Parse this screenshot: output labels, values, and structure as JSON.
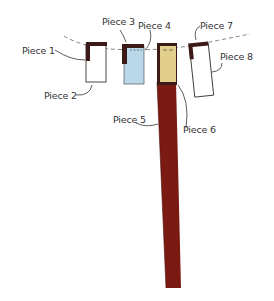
{
  "diagram": {
    "title": "",
    "labels": [
      {
        "id": "piece-1",
        "text": "Piece 1"
      },
      {
        "id": "piece-2",
        "text": "Piece 2"
      },
      {
        "id": "piece-3",
        "text": "Piece 3"
      },
      {
        "id": "piece-4",
        "text": "Piece 4"
      },
      {
        "id": "piece-5",
        "text": "Piece 5"
      },
      {
        "id": "piece-6",
        "text": "Piece 6"
      },
      {
        "id": "piece-7",
        "text": "Piece 7"
      },
      {
        "id": "piece-8",
        "text": "Piece 8"
      }
    ],
    "colors": {
      "dark_brown": "#3b1a17",
      "light_blue": "#b9d8ea",
      "tan": "#e2cf8b",
      "dark_red": "#7b1a13",
      "white": "#ffffff",
      "outline": "#333333",
      "dashed_line": "#666666"
    }
  }
}
